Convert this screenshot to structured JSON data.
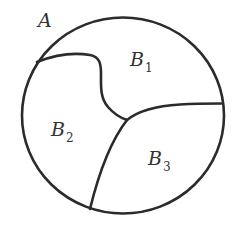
{
  "diagram": {
    "outer_set": {
      "label": "A",
      "shape": "circle"
    },
    "regions": [
      {
        "id": "B1",
        "letter": "B",
        "subscript": "1"
      },
      {
        "id": "B2",
        "letter": "B",
        "subscript": "2"
      },
      {
        "id": "B3",
        "letter": "B",
        "subscript": "3"
      }
    ],
    "colors": {
      "stroke": "#2b2b2b",
      "text": "#333333",
      "background": "#ffffff"
    }
  }
}
